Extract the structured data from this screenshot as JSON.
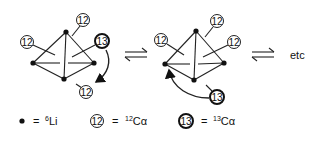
{
  "diagram": {
    "equilibrium_symbol": "⇌",
    "continuation_label": "etc",
    "structures": [
      {
        "id": "tetramer-1",
        "vertices": [
          [
            66,
            32
          ],
          [
            33,
            63
          ],
          [
            94,
            63
          ],
          [
            64,
            79
          ]
        ],
        "substituents": [
          {
            "label": "12",
            "cx": 83,
            "cy": 20,
            "bold": false,
            "attach": [
              72,
              36
            ]
          },
          {
            "label": "12",
            "cx": 27,
            "cy": 42,
            "bold": false,
            "attach": [
              55,
              55
            ]
          },
          {
            "label": "13",
            "cx": 102,
            "cy": 41,
            "bold": true,
            "attach": [
              72,
              57
            ]
          },
          {
            "label": "12",
            "cx": 86,
            "cy": 92,
            "bold": false,
            "attach": [
              76,
              84
            ]
          }
        ],
        "arrow": "curved arrow from 13 downward toward bottom 12 position"
      },
      {
        "id": "tetramer-2",
        "vertices": [
          [
            196,
            31
          ],
          [
            165,
            64
          ],
          [
            224,
            63
          ],
          [
            194,
            80
          ]
        ],
        "substituents": [
          {
            "label": "12",
            "cx": 217,
            "cy": 21,
            "bold": false,
            "attach": [
              205,
              37
            ]
          },
          {
            "label": "12",
            "cx": 161,
            "cy": 40,
            "bold": false,
            "attach": [
              184,
              55
            ]
          },
          {
            "label": "12",
            "cx": 234,
            "cy": 42,
            "bold": false,
            "attach": [
              203,
              57
            ]
          },
          {
            "label": "13",
            "cx": 217,
            "cy": 97,
            "bold": true,
            "attach": [
              206,
              85
            ]
          }
        ],
        "arrow": "curved arrow from 13 toward left vertex"
      }
    ]
  },
  "legend": {
    "items": [
      {
        "symbol": "dot",
        "equals": "=",
        "sup": "6",
        "text": "Li"
      },
      {
        "symbol": "circle-12",
        "label": "12",
        "equals": "=",
        "sup": "12",
        "text": "Cα"
      },
      {
        "symbol": "circle-13",
        "label": "13",
        "equals": "=",
        "sup": "13",
        "text": "Cα"
      }
    ]
  }
}
